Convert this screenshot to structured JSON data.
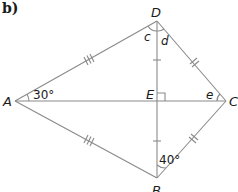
{
  "part_label": "b)",
  "vertices": {
    "A": {
      "label": "A",
      "x": 15,
      "y": 101
    },
    "B": {
      "label": "B",
      "x": 157,
      "y": 178
    },
    "C": {
      "label": "C",
      "x": 226,
      "y": 101
    },
    "D": {
      "label": "D",
      "x": 157,
      "y": 21
    },
    "E": {
      "label": "E",
      "x": 157,
      "y": 101
    }
  },
  "angles": {
    "A": "30°",
    "B": "40°",
    "c": "c",
    "d": "d",
    "e": "e"
  },
  "markings": {
    "AD_AB": "triple tick (equal)",
    "DC_BC": "double tick (equal)",
    "DE_EB": "single tick (equal)",
    "E": "right angle"
  },
  "colors": {
    "line": "#8a8a8a",
    "text": "#1a1a1a"
  }
}
